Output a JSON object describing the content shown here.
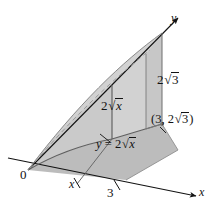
{
  "figure": {
    "kind": "3d-solid-diagram",
    "background_color": "#ffffff",
    "ink_color": "#121212",
    "fill_base_color": "#b9b9b9",
    "fill_wall_color": "#a8a8a8",
    "fill_surface_color": "#cfcfcf",
    "axes": {
      "x_label": "x",
      "y_label": "y",
      "origin_label": "0"
    },
    "ticks": {
      "x_variable": "x",
      "x_upper": "3"
    },
    "labels": {
      "height_at_x": {
        "coefficient": "2",
        "radicand": "x"
      },
      "height_at_three": {
        "coefficient": "2",
        "radicand": "3"
      },
      "curve_equation": {
        "lhs": "y",
        "relation": "=",
        "coefficient": "2",
        "radicand": "x"
      },
      "corner_point": {
        "open": "(",
        "first": "3",
        "separator": ", ",
        "coefficient": "2",
        "radicand": "3",
        "close": ")"
      }
    }
  }
}
